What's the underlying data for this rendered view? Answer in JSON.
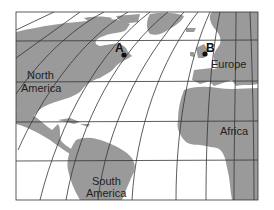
{
  "map": {
    "labels": {
      "north_america_1": "North",
      "north_america_2": "America",
      "south_america_1": "South",
      "south_america_2": "America",
      "europe": "Europe",
      "africa": "Africa"
    },
    "points": [
      {
        "id": "A",
        "label": "A"
      },
      {
        "id": "B",
        "label": "B"
      }
    ],
    "colors": {
      "land": "#9a9a9a",
      "water": "#ffffff",
      "grid": "#333333"
    }
  }
}
